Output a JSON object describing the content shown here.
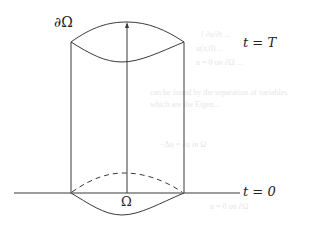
{
  "diagram": {
    "labels": {
      "boundary": "∂Ω",
      "top_time": "t = T",
      "bottom_time": "t = 0",
      "domain": "Ω"
    },
    "colors": {
      "stroke": "#3a3a3a",
      "text": "#222222",
      "background": "#ffffff"
    },
    "elements": [
      "space-time cylinder with curved top cap (t = T)",
      "vertical arrow along center axis to top cap",
      "ground line at t = 0",
      "dashed back edge of base domain",
      "solid front edge of base domain"
    ],
    "ghost_text": [
      "{ ∂u/∂t ...",
      "u(x,0) ...",
      "u = 0   on ∂Ω ...",
      "can be found by the separation of variables...",
      "which are the Eigen...",
      "−Δu = λu in Ω",
      "u = 0 on ∂Ω"
    ]
  }
}
